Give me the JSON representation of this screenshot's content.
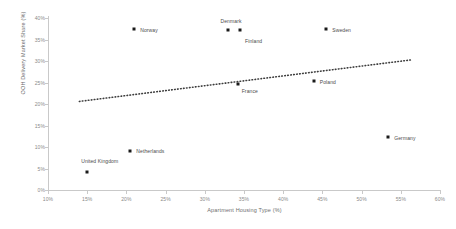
{
  "chart_data": {
    "type": "scatter",
    "title": "",
    "xlabel": "Apartment Housing Type (%)",
    "ylabel": "OOH Delivery Market Share (%)",
    "xlim": [
      10,
      60
    ],
    "ylim": [
      0,
      40
    ],
    "xticks": [
      "10%",
      "15%",
      "20%",
      "25%",
      "30%",
      "35%",
      "40%",
      "45%",
      "50%",
      "55%",
      "60%"
    ],
    "xtick_values": [
      10,
      15,
      20,
      25,
      30,
      35,
      40,
      45,
      50,
      55,
      60
    ],
    "yticks": [
      "0%",
      "5%",
      "10%",
      "15%",
      "20%",
      "25%",
      "30%",
      "35%",
      "40%"
    ],
    "ytick_values": [
      0,
      5,
      10,
      15,
      20,
      25,
      30,
      35,
      40
    ],
    "grid": false,
    "legend": "none",
    "points": [
      {
        "label": "United Kingdom",
        "x": 15.0,
        "y": 4.2,
        "label_dx": -6,
        "label_dy": -14,
        "label_align": "left"
      },
      {
        "label": "Netherlands",
        "x": 20.5,
        "y": 9.0,
        "label_dx": 6,
        "label_dy": -3,
        "label_align": "left"
      },
      {
        "label": "Norway",
        "x": 21.0,
        "y": 37.5,
        "label_dx": 6,
        "label_dy": -2,
        "label_align": "left"
      },
      {
        "label": "Denmark",
        "x": 32.9,
        "y": 37.2,
        "label_dx": -7,
        "label_dy": -12,
        "label_align": "left"
      },
      {
        "label": "Finland",
        "x": 34.5,
        "y": 37.2,
        "label_dx": 5,
        "label_dy": 8,
        "label_align": "left"
      },
      {
        "label": "France",
        "x": 34.2,
        "y": 24.7,
        "label_dx": 4,
        "label_dy": 4,
        "label_align": "left"
      },
      {
        "label": "Poland",
        "x": 43.9,
        "y": 25.4,
        "label_dx": 6,
        "label_dy": -2,
        "label_align": "left"
      },
      {
        "label": "Sweden",
        "x": 45.5,
        "y": 37.5,
        "label_dx": 6,
        "label_dy": -2,
        "label_align": "left"
      },
      {
        "label": "Germany",
        "x": 53.4,
        "y": 12.4,
        "label_dx": 6,
        "label_dy": -2,
        "label_align": "left"
      }
    ],
    "trendline": {
      "style": "dotted",
      "color": "#3d3d3d",
      "x_start": 14.0,
      "y_start": 20.6,
      "x_end": 56.5,
      "y_end": 30.3
    },
    "colors": {
      "marker": "#1a1a1a",
      "axis": "#c9c9c9",
      "tick_text": "#8a8a8a",
      "axis_title": "#6e6e6e",
      "point_label": "#4a4a4a",
      "background": "#ffffff"
    }
  }
}
